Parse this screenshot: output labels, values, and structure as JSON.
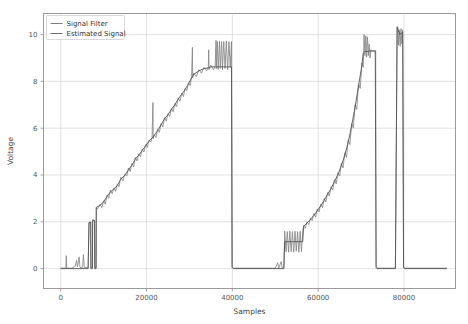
{
  "chart_data": {
    "type": "line",
    "title": "",
    "xlabel": "Samples",
    "ylabel": "Voltage",
    "xlim": [
      -4000,
      92000
    ],
    "ylim": [
      -0.85,
      10.9
    ],
    "xticks": [
      0,
      20000,
      40000,
      60000,
      80000
    ],
    "xticklabels": [
      "0",
      "20000",
      "40000",
      "60000",
      "80000"
    ],
    "yticks": [
      0,
      2,
      4,
      6,
      8,
      10
    ],
    "yticklabels": [
      "0",
      "2",
      "4",
      "6",
      "8",
      "10"
    ],
    "grid": true,
    "legend_position": "upper left",
    "legend": [
      {
        "name": "Signal Filter",
        "color": "#7a7a7a"
      },
      {
        "name": "Estimated Signal",
        "color": "#6e6e6e"
      }
    ],
    "series": [
      {
        "name": "Signal Filter",
        "color": "#808080",
        "linewidth": 0.8,
        "description": "Noisy raw staircase signal with spikes",
        "points": [
          [
            0,
            0.02
          ],
          [
            1200,
            0.02
          ],
          [
            1300,
            0.55
          ],
          [
            1420,
            0.02
          ],
          [
            2600,
            0.02
          ],
          [
            3400,
            0.1
          ],
          [
            3700,
            0.35
          ],
          [
            3900,
            0.08
          ],
          [
            4300,
            0.5
          ],
          [
            4500,
            0.05
          ],
          [
            5100,
            0.05
          ],
          [
            5300,
            0.6
          ],
          [
            5500,
            0.05
          ],
          [
            6400,
            0.05
          ],
          [
            6600,
            1.95
          ],
          [
            7000,
            2.0
          ],
          [
            7050,
            0.05
          ],
          [
            7400,
            0.05
          ],
          [
            7450,
            2.1
          ],
          [
            7900,
            2.05
          ],
          [
            7950,
            0.05
          ],
          [
            8250,
            0.05
          ],
          [
            8300,
            2.6
          ],
          [
            8600,
            2.55
          ],
          [
            9200,
            2.75
          ],
          [
            9600,
            2.6
          ],
          [
            10000,
            2.9
          ],
          [
            10400,
            2.75
          ],
          [
            10800,
            3.15
          ],
          [
            11200,
            3.0
          ],
          [
            11600,
            3.35
          ],
          [
            12000,
            3.2
          ],
          [
            12400,
            3.45
          ],
          [
            12800,
            3.3
          ],
          [
            13200,
            3.6
          ],
          [
            13600,
            3.5
          ],
          [
            14000,
            3.9
          ],
          [
            14500,
            3.75
          ],
          [
            15000,
            4.05
          ],
          [
            15400,
            3.95
          ],
          [
            15800,
            4.3
          ],
          [
            16200,
            4.15
          ],
          [
            16600,
            4.5
          ],
          [
            17000,
            4.35
          ],
          [
            17400,
            4.75
          ],
          [
            17800,
            4.6
          ],
          [
            18200,
            4.9
          ],
          [
            18600,
            4.78
          ],
          [
            19000,
            5.1
          ],
          [
            19400,
            4.98
          ],
          [
            19800,
            5.3
          ],
          [
            20200,
            5.18
          ],
          [
            20600,
            5.5
          ],
          [
            21000,
            5.4
          ],
          [
            21300,
            5.6
          ],
          [
            21500,
            7.1
          ],
          [
            21560,
            5.55
          ],
          [
            21800,
            5.72
          ],
          [
            22200,
            5.6
          ],
          [
            22600,
            5.95
          ],
          [
            23000,
            5.82
          ],
          [
            23400,
            6.2
          ],
          [
            23800,
            6.05
          ],
          [
            24200,
            6.45
          ],
          [
            24600,
            6.3
          ],
          [
            25000,
            6.62
          ],
          [
            25400,
            6.5
          ],
          [
            25800,
            6.85
          ],
          [
            26200,
            6.7
          ],
          [
            26600,
            7.05
          ],
          [
            27000,
            6.92
          ],
          [
            27400,
            7.3
          ],
          [
            27800,
            7.15
          ],
          [
            28200,
            7.5
          ],
          [
            28600,
            7.35
          ],
          [
            29000,
            7.7
          ],
          [
            29400,
            7.6
          ],
          [
            29800,
            7.95
          ],
          [
            30200,
            7.82
          ],
          [
            30500,
            8.2
          ],
          [
            30700,
            9.45
          ],
          [
            30760,
            8.15
          ],
          [
            31000,
            8.35
          ],
          [
            31600,
            8.2
          ],
          [
            32200,
            8.5
          ],
          [
            32800,
            8.35
          ],
          [
            33400,
            8.6
          ],
          [
            34000,
            8.45
          ],
          [
            34400,
            8.6
          ],
          [
            34500,
            9.35
          ],
          [
            34560,
            8.5
          ],
          [
            35000,
            8.7
          ],
          [
            35600,
            8.5
          ],
          [
            36000,
            8.65
          ],
          [
            36200,
            9.75
          ],
          [
            36260,
            8.55
          ],
          [
            36500,
            9.7
          ],
          [
            36700,
            8.5
          ],
          [
            37000,
            9.72
          ],
          [
            37200,
            8.55
          ],
          [
            37500,
            9.7
          ],
          [
            37700,
            8.5
          ],
          [
            38000,
            9.7
          ],
          [
            38300,
            8.55
          ],
          [
            38600,
            9.72
          ],
          [
            38900,
            8.5
          ],
          [
            39200,
            9.7
          ],
          [
            39500,
            8.6
          ],
          [
            39800,
            9.7
          ],
          [
            39950,
            0.1
          ],
          [
            40200,
            0.02
          ],
          [
            44000,
            0.02
          ],
          [
            48000,
            0.02
          ],
          [
            50000,
            0.02
          ],
          [
            50600,
            0.25
          ],
          [
            50800,
            0.02
          ],
          [
            51400,
            0.3
          ],
          [
            51600,
            0.02
          ],
          [
            52000,
            0.02
          ],
          [
            52200,
            1.6
          ],
          [
            52500,
            0.72
          ],
          [
            52800,
            1.58
          ],
          [
            53100,
            0.7
          ],
          [
            53400,
            1.6
          ],
          [
            53700,
            0.72
          ],
          [
            54000,
            1.58
          ],
          [
            54300,
            0.7
          ],
          [
            54600,
            1.6
          ],
          [
            54900,
            0.74
          ],
          [
            55200,
            1.58
          ],
          [
            55500,
            0.7
          ],
          [
            55800,
            1.6
          ],
          [
            56100,
            0.72
          ],
          [
            56400,
            1.58
          ],
          [
            56600,
            1.85
          ],
          [
            57000,
            1.72
          ],
          [
            57400,
            2.0
          ],
          [
            57800,
            1.88
          ],
          [
            58200,
            2.15
          ],
          [
            58600,
            2.05
          ],
          [
            59000,
            2.35
          ],
          [
            59400,
            2.2
          ],
          [
            59800,
            2.55
          ],
          [
            60200,
            2.42
          ],
          [
            60600,
            2.75
          ],
          [
            61000,
            2.6
          ],
          [
            61400,
            3.0
          ],
          [
            61800,
            2.85
          ],
          [
            62200,
            3.25
          ],
          [
            62600,
            3.1
          ],
          [
            63000,
            3.5
          ],
          [
            63400,
            3.35
          ],
          [
            63800,
            3.8
          ],
          [
            64200,
            3.62
          ],
          [
            64600,
            4.1
          ],
          [
            65000,
            3.95
          ],
          [
            65400,
            4.5
          ],
          [
            65800,
            4.3
          ],
          [
            66200,
            4.95
          ],
          [
            66600,
            4.75
          ],
          [
            67000,
            5.5
          ],
          [
            67400,
            5.3
          ],
          [
            67800,
            6.2
          ],
          [
            68200,
            6.0
          ],
          [
            68600,
            7.0
          ],
          [
            69000,
            6.8
          ],
          [
            69400,
            7.9
          ],
          [
            69800,
            7.7
          ],
          [
            70200,
            8.8
          ],
          [
            70500,
            8.6
          ],
          [
            70700,
            10.0
          ],
          [
            70900,
            9.1
          ],
          [
            71100,
            9.95
          ],
          [
            71300,
            9.05
          ],
          [
            71500,
            9.9
          ],
          [
            71700,
            9.1
          ],
          [
            71900,
            9.6
          ],
          [
            72100,
            9.0
          ],
          [
            72300,
            9.35
          ],
          [
            72600,
            9.3
          ],
          [
            73000,
            9.3
          ],
          [
            73300,
            9.3
          ],
          [
            73400,
            9.32
          ],
          [
            73500,
            0.1
          ],
          [
            73700,
            0.02
          ],
          [
            76000,
            0.02
          ],
          [
            78000,
            0.02
          ],
          [
            78400,
            10.35
          ],
          [
            78600,
            10.3
          ],
          [
            78700,
            9.55
          ],
          [
            78900,
            10.2
          ],
          [
            79100,
            9.5
          ],
          [
            79300,
            10.25
          ],
          [
            79500,
            9.6
          ],
          [
            79700,
            10.2
          ],
          [
            79900,
            0.1
          ],
          [
            80100,
            0.02
          ],
          [
            84000,
            0.02
          ],
          [
            88000,
            0.02
          ],
          [
            90000,
            0.02
          ]
        ]
      },
      {
        "name": "Estimated Signal",
        "color": "#555555",
        "linewidth": 0.9,
        "description": "Smoothed estimated staircase",
        "points": [
          [
            0,
            0.0
          ],
          [
            6400,
            0.0
          ],
          [
            6600,
            1.98
          ],
          [
            7000,
            1.98
          ],
          [
            7050,
            0.0
          ],
          [
            7400,
            0.0
          ],
          [
            7450,
            2.05
          ],
          [
            7900,
            2.05
          ],
          [
            7950,
            0.0
          ],
          [
            8250,
            0.0
          ],
          [
            8300,
            2.62
          ],
          [
            9200,
            2.7
          ],
          [
            10000,
            2.85
          ],
          [
            10800,
            3.08
          ],
          [
            11600,
            3.28
          ],
          [
            12400,
            3.4
          ],
          [
            13200,
            3.55
          ],
          [
            14000,
            3.82
          ],
          [
            15000,
            4.0
          ],
          [
            15800,
            4.22
          ],
          [
            16600,
            4.42
          ],
          [
            17400,
            4.68
          ],
          [
            18200,
            4.85
          ],
          [
            19000,
            5.05
          ],
          [
            19800,
            5.25
          ],
          [
            20600,
            5.45
          ],
          [
            21300,
            5.58
          ],
          [
            21800,
            5.68
          ],
          [
            22600,
            5.9
          ],
          [
            23400,
            6.15
          ],
          [
            24200,
            6.4
          ],
          [
            25000,
            6.58
          ],
          [
            25800,
            6.8
          ],
          [
            26600,
            7.0
          ],
          [
            27400,
            7.25
          ],
          [
            28200,
            7.45
          ],
          [
            29000,
            7.65
          ],
          [
            29800,
            7.9
          ],
          [
            30500,
            8.15
          ],
          [
            31000,
            8.3
          ],
          [
            32200,
            8.45
          ],
          [
            33400,
            8.55
          ],
          [
            34400,
            8.58
          ],
          [
            35000,
            8.62
          ],
          [
            36000,
            8.62
          ],
          [
            36200,
            8.62
          ],
          [
            37000,
            8.62
          ],
          [
            38000,
            8.62
          ],
          [
            39000,
            8.62
          ],
          [
            39800,
            8.62
          ],
          [
            39950,
            0.05
          ],
          [
            40200,
            0.0
          ],
          [
            52000,
            0.0
          ],
          [
            52200,
            1.15
          ],
          [
            54000,
            1.15
          ],
          [
            56400,
            1.15
          ],
          [
            56600,
            1.8
          ],
          [
            57400,
            1.95
          ],
          [
            58200,
            2.1
          ],
          [
            59000,
            2.28
          ],
          [
            59800,
            2.48
          ],
          [
            60600,
            2.68
          ],
          [
            61400,
            2.92
          ],
          [
            62200,
            3.18
          ],
          [
            63000,
            3.42
          ],
          [
            63800,
            3.72
          ],
          [
            64600,
            4.02
          ],
          [
            65400,
            4.4
          ],
          [
            66200,
            4.85
          ],
          [
            67000,
            5.4
          ],
          [
            67800,
            6.1
          ],
          [
            68600,
            6.9
          ],
          [
            69400,
            7.8
          ],
          [
            70200,
            8.7
          ],
          [
            70500,
            9.2
          ],
          [
            70900,
            9.28
          ],
          [
            71500,
            9.28
          ],
          [
            72300,
            9.3
          ],
          [
            73300,
            9.3
          ],
          [
            73500,
            0.05
          ],
          [
            73700,
            0.0
          ],
          [
            78000,
            0.0
          ],
          [
            78400,
            10.3
          ],
          [
            79000,
            10.0
          ],
          [
            79700,
            10.1
          ],
          [
            79900,
            0.05
          ],
          [
            80100,
            0.0
          ],
          [
            90000,
            0.0
          ]
        ]
      }
    ]
  },
  "figure": {
    "background": "#ffffff",
    "grid_color": "#d6d6d6",
    "spine_color": "#9a9a9a",
    "tick_color": "#555555"
  }
}
